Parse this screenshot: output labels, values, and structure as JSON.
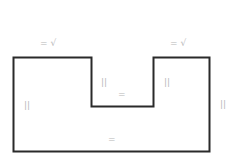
{
  "diagram": {
    "type": "notched-rectangle-outline",
    "stroke_color": "#2a2a2a",
    "mark_color": "#b8b8b8",
    "labels": {
      "top_left_edge": "= √",
      "top_right_edge": "= √",
      "notch_left_wall": "||",
      "notch_bottom": "=",
      "notch_right_wall": "||",
      "left_edge": "||",
      "right_edge": "||",
      "bottom_edge": "="
    }
  }
}
